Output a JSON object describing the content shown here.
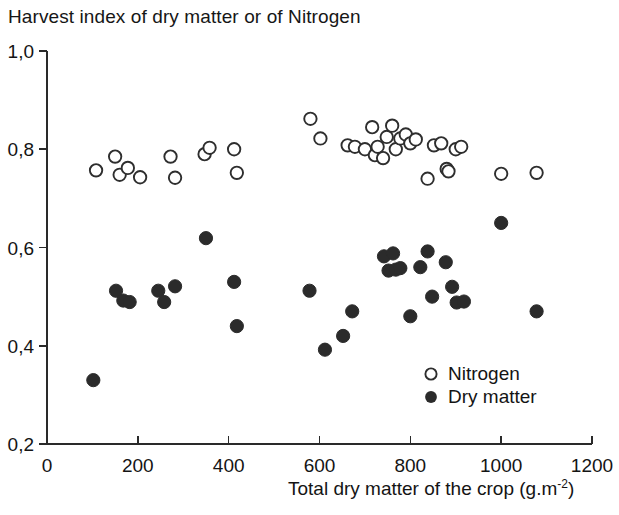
{
  "chart_data": {
    "type": "scatter",
    "title": "Harvest index of dry matter or of Nitrogen",
    "xlabel": "Total dry matter of the crop (g.m-2)",
    "xlabel_base": "Total dry matter of the crop (g.m",
    "xlabel_exponent": "-2",
    "xlabel_tail": ")",
    "ylabel": "Harvest index of dry matter or of Nitrogen",
    "xlim": [
      0,
      1200
    ],
    "ylim": [
      0.2,
      1.0
    ],
    "grid": false,
    "xticks": [
      0,
      200,
      400,
      600,
      800,
      1000,
      1200
    ],
    "yticks": [
      0.2,
      0.4,
      0.6,
      0.8,
      1.0
    ],
    "xtick_labels": [
      "0",
      "200",
      "400",
      "600",
      "800",
      "1000",
      "1200"
    ],
    "ytick_labels": [
      "0,2",
      "0,4",
      "0,6",
      "0,8",
      "1,0"
    ],
    "legend_position": "inside-lower-right",
    "series": [
      {
        "name": "Nitrogen",
        "marker": "open-circle",
        "color": "#2e2e2e",
        "points": [
          [
            108,
            0.757
          ],
          [
            150,
            0.785
          ],
          [
            160,
            0.748
          ],
          [
            178,
            0.762
          ],
          [
            205,
            0.743
          ],
          [
            272,
            0.785
          ],
          [
            282,
            0.742
          ],
          [
            347,
            0.79
          ],
          [
            358,
            0.803
          ],
          [
            412,
            0.8
          ],
          [
            418,
            0.752
          ],
          [
            580,
            0.862
          ],
          [
            602,
            0.822
          ],
          [
            662,
            0.808
          ],
          [
            678,
            0.805
          ],
          [
            700,
            0.8
          ],
          [
            716,
            0.845
          ],
          [
            722,
            0.788
          ],
          [
            728,
            0.805
          ],
          [
            740,
            0.782
          ],
          [
            748,
            0.825
          ],
          [
            760,
            0.848
          ],
          [
            768,
            0.8
          ],
          [
            778,
            0.822
          ],
          [
            790,
            0.83
          ],
          [
            800,
            0.812
          ],
          [
            812,
            0.82
          ],
          [
            838,
            0.74
          ],
          [
            852,
            0.808
          ],
          [
            868,
            0.812
          ],
          [
            880,
            0.76
          ],
          [
            884,
            0.755
          ],
          [
            900,
            0.8
          ],
          [
            912,
            0.805
          ],
          [
            1000,
            0.75
          ],
          [
            1078,
            0.752
          ]
        ]
      },
      {
        "name": "Dry matter",
        "marker": "filled-circle",
        "color": "#2b2b2b",
        "points": [
          [
            102,
            0.33
          ],
          [
            152,
            0.512
          ],
          [
            168,
            0.492
          ],
          [
            182,
            0.489
          ],
          [
            245,
            0.512
          ],
          [
            258,
            0.489
          ],
          [
            282,
            0.521
          ],
          [
            350,
            0.619
          ],
          [
            412,
            0.53
          ],
          [
            418,
            0.44
          ],
          [
            578,
            0.512
          ],
          [
            612,
            0.392
          ],
          [
            652,
            0.42
          ],
          [
            672,
            0.47
          ],
          [
            742,
            0.582
          ],
          [
            752,
            0.553
          ],
          [
            762,
            0.588
          ],
          [
            768,
            0.555
          ],
          [
            778,
            0.558
          ],
          [
            800,
            0.46
          ],
          [
            822,
            0.56
          ],
          [
            838,
            0.592
          ],
          [
            848,
            0.5
          ],
          [
            878,
            0.57
          ],
          [
            892,
            0.52
          ],
          [
            902,
            0.488
          ],
          [
            918,
            0.49
          ],
          [
            1000,
            0.65
          ],
          [
            1078,
            0.47
          ]
        ]
      }
    ]
  },
  "legend": {
    "items": [
      {
        "label": "Nitrogen",
        "marker": "open-circle"
      },
      {
        "label": "Dry matter",
        "marker": "filled-circle"
      }
    ]
  }
}
